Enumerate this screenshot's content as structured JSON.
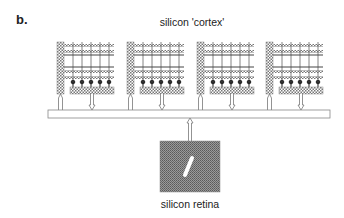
{
  "panel_label": "b.",
  "title": "silicon 'cortex'",
  "caption": "silicon retina",
  "diagram": {
    "modules": [
      {
        "name": "cortex-module-1",
        "x": 57
      },
      {
        "name": "cortex-module-2",
        "x": 127
      },
      {
        "name": "cortex-module-3",
        "x": 197
      },
      {
        "name": "cortex-module-4",
        "x": 266
      }
    ],
    "neurons_per_module": 5,
    "bus": {
      "label": "address-event bus"
    },
    "retina": {
      "label": "silicon retina",
      "stimulus": "oriented bar"
    }
  }
}
